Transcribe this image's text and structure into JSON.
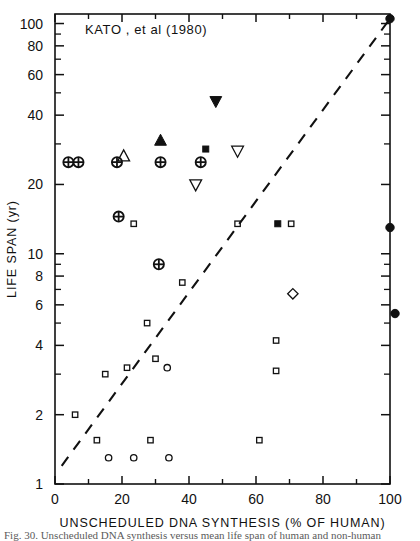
{
  "figure": {
    "title": "KATO , et al (1980)",
    "caption_partial": "Fig. 30.  Unscheduled DNA synthesis versus mean life span of human and non-human"
  },
  "chart_data": {
    "type": "scatter",
    "title": "KATO , et al (1980)",
    "xlabel": "UNSCHEDULED DNA SYNTHESIS (% OF HUMAN)",
    "ylabel": "LIFE SPAN (yr)",
    "xscale": "linear",
    "yscale": "log",
    "xlim": [
      0,
      100
    ],
    "ylim": [
      1,
      110
    ],
    "grid": false,
    "legend": "none",
    "xticks": [
      0,
      20,
      40,
      60,
      80,
      100
    ],
    "xtick_labels": [
      "0",
      "20",
      "40",
      "60",
      "80",
      "100"
    ],
    "xminor_ticks": [
      10,
      30,
      50,
      70,
      90
    ],
    "yticks": [
      1,
      2,
      4,
      6,
      8,
      10,
      20,
      40,
      60,
      80,
      100
    ],
    "ytick_labels": [
      "1",
      "2",
      "4",
      "6",
      "8",
      "10",
      "20",
      "40",
      "60",
      "80",
      "100"
    ],
    "yminor_ticks": [
      3,
      5,
      7,
      9,
      30,
      50,
      70,
      90
    ],
    "reference_line": {
      "style": "dashed",
      "x": [
        2,
        100
      ],
      "y": [
        1.2,
        105
      ]
    },
    "series": [
      {
        "name": "circled-plus",
        "marker": "circle-plus",
        "filled": false,
        "points": [
          {
            "x": 4.0,
            "y": 25.0
          },
          {
            "x": 7.0,
            "y": 25.0
          },
          {
            "x": 18.5,
            "y": 25.0
          },
          {
            "x": 31.5,
            "y": 25.0
          },
          {
            "x": 43.5,
            "y": 25.0
          },
          {
            "x": 19.0,
            "y": 14.5
          },
          {
            "x": 31.0,
            "y": 9.0
          }
        ]
      },
      {
        "name": "open-square",
        "marker": "square",
        "filled": false,
        "points": [
          {
            "x": 23.5,
            "y": 13.5
          },
          {
            "x": 54.5,
            "y": 13.5
          },
          {
            "x": 70.5,
            "y": 13.5
          },
          {
            "x": 38.0,
            "y": 7.5
          },
          {
            "x": 27.5,
            "y": 5.0
          },
          {
            "x": 66.0,
            "y": 4.2
          },
          {
            "x": 30.0,
            "y": 3.5
          },
          {
            "x": 21.5,
            "y": 3.2
          },
          {
            "x": 66.0,
            "y": 3.1
          },
          {
            "x": 15.0,
            "y": 3.0
          },
          {
            "x": 6.0,
            "y": 2.0
          },
          {
            "x": 12.5,
            "y": 1.55
          },
          {
            "x": 28.5,
            "y": 1.55
          },
          {
            "x": 61.0,
            "y": 1.55
          }
        ]
      },
      {
        "name": "open-circle",
        "marker": "circle",
        "filled": false,
        "points": [
          {
            "x": 33.5,
            "y": 3.2
          },
          {
            "x": 16.0,
            "y": 1.3
          },
          {
            "x": 23.5,
            "y": 1.3
          },
          {
            "x": 34.0,
            "y": 1.3
          }
        ]
      },
      {
        "name": "filled-circle",
        "marker": "circle",
        "filled": true,
        "points": [
          {
            "x": 100.0,
            "y": 105.0
          },
          {
            "x": 100.0,
            "y": 13.0
          },
          {
            "x": 101.5,
            "y": 5.5
          }
        ]
      },
      {
        "name": "filled-triangle-up",
        "marker": "triangle-up",
        "filled": true,
        "points": [
          {
            "x": 31.5,
            "y": 31.0
          }
        ]
      },
      {
        "name": "open-triangle-up",
        "marker": "triangle-up",
        "filled": false,
        "points": [
          {
            "x": 20.5,
            "y": 26.5
          }
        ]
      },
      {
        "name": "filled-triangle-down",
        "marker": "triangle-down",
        "filled": true,
        "points": [
          {
            "x": 48.0,
            "y": 46.0
          }
        ]
      },
      {
        "name": "open-triangle-down",
        "marker": "triangle-down",
        "filled": false,
        "points": [
          {
            "x": 54.5,
            "y": 28.0
          },
          {
            "x": 42.0,
            "y": 20.0
          }
        ]
      },
      {
        "name": "filled-square",
        "marker": "square",
        "filled": true,
        "points": [
          {
            "x": 45.0,
            "y": 28.5
          },
          {
            "x": 66.5,
            "y": 13.5
          }
        ]
      },
      {
        "name": "open-diamond",
        "marker": "diamond",
        "filled": false,
        "points": [
          {
            "x": 71.0,
            "y": 6.7
          }
        ]
      }
    ]
  }
}
